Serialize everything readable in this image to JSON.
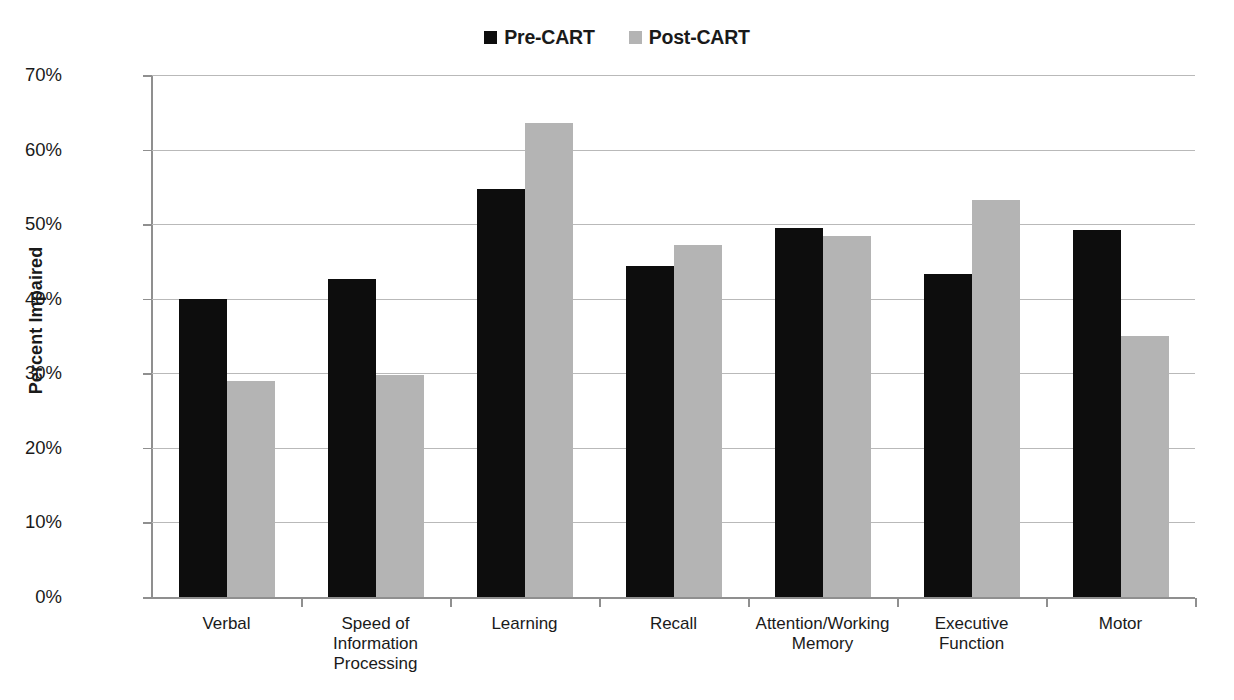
{
  "chart_data": {
    "type": "bar",
    "title": "",
    "xlabel": "",
    "ylabel": "Percent Impaired",
    "ylim": [
      0,
      70
    ],
    "ytick_values": [
      0,
      10,
      20,
      30,
      40,
      50,
      60,
      70
    ],
    "ytick_labels": [
      "0%",
      "10%",
      "20%",
      "30%",
      "40%",
      "50%",
      "60%",
      "70%"
    ],
    "grid": "horizontal",
    "legend_position": "top-center",
    "categories": [
      "Verbal",
      "Speed of\nInformation\nProcessing",
      "Learning",
      "Recall",
      "Attention/Working\nMemory",
      "Executive\nFunction",
      "Motor"
    ],
    "series": [
      {
        "name": "Pre-CART",
        "color": "#0d0d0d",
        "values": [
          40.0,
          42.7,
          54.7,
          44.4,
          49.5,
          43.3,
          49.2
        ]
      },
      {
        "name": "Post-CART",
        "color": "#b4b4b4",
        "values": [
          29.0,
          29.8,
          63.6,
          47.2,
          48.4,
          53.2,
          35.0
        ]
      }
    ]
  },
  "legend": {
    "entries": [
      {
        "label": "Pre-CART",
        "color": "#0d0d0d",
        "marker": "square-marker-black"
      },
      {
        "label": "Post-CART",
        "color": "#b4b4b4",
        "marker": "square-marker-gray"
      }
    ]
  },
  "axis": {
    "y_title": "Percent Impaired"
  }
}
